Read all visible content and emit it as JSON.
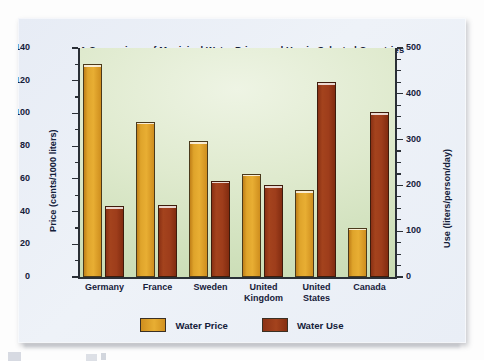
{
  "chart_data": {
    "type": "bar",
    "title": "A Comparison of Municipal Water Prices and Use in Selected Countries",
    "categories": [
      "Germany",
      "France",
      "Sweden",
      "United\nKingdom",
      "United\nStates",
      "Canada"
    ],
    "series": [
      {
        "name": "Water Price",
        "axis": "left",
        "unit": "cents/1000 liters",
        "color": "#e0a32b",
        "values": [
          130,
          95,
          83,
          63,
          53,
          30
        ]
      },
      {
        "name": "Water Use",
        "axis": "right",
        "unit": "liters/person/day",
        "color": "#9e3d1b",
        "values": [
          155,
          157,
          210,
          200,
          425,
          360
        ]
      }
    ],
    "left_axis": {
      "label": "Price (cents/1000 liters)",
      "ticks": [
        0,
        20,
        40,
        60,
        80,
        100,
        120,
        140
      ],
      "lim": [
        0,
        140
      ],
      "minor_step": 10
    },
    "right_axis": {
      "label": "Use (liters/person/day)",
      "ticks": [
        0,
        100,
        200,
        300,
        400,
        500
      ],
      "lim": [
        0,
        500
      ],
      "minor_step": 25
    },
    "legend": {
      "position": "bottom-center",
      "entries": [
        "Water Price",
        "Water Use"
      ]
    },
    "grid": false,
    "xlabel": "",
    "plot_background": "#dcebcb"
  }
}
